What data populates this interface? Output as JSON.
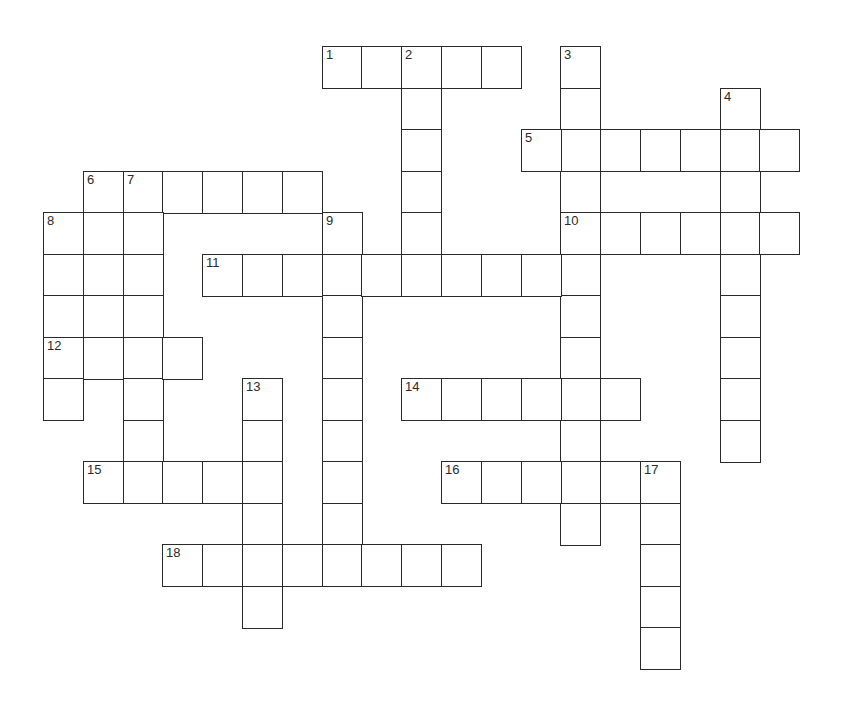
{
  "puzzle": {
    "title": "Crossword",
    "layout": {
      "origin_x": 43,
      "origin_y": 46,
      "cell_w": 39.8,
      "cell_h": 41.5
    },
    "colors": {
      "line": "#2a2a2a",
      "cell": "#ffffff",
      "background": "#ffffff"
    },
    "words": [
      {
        "number": 1,
        "direction": "across",
        "row": 0,
        "col": 7,
        "length": 5
      },
      {
        "number": 2,
        "direction": "down",
        "row": 0,
        "col": 9,
        "length": 6
      },
      {
        "number": 3,
        "direction": "down",
        "row": 0,
        "col": 13,
        "length": 12
      },
      {
        "number": 4,
        "direction": "down",
        "row": 1,
        "col": 17,
        "length": 9
      },
      {
        "number": 5,
        "direction": "across",
        "row": 2,
        "col": 12,
        "length": 7
      },
      {
        "number": 6,
        "direction": "across",
        "row": 3,
        "col": 1,
        "length": 6
      },
      {
        "number": 6,
        "direction": "down",
        "row": 3,
        "col": 1,
        "length": 5
      },
      {
        "number": 7,
        "direction": "down",
        "row": 3,
        "col": 2,
        "length": 8
      },
      {
        "number": 8,
        "direction": "down",
        "row": 4,
        "col": 0,
        "length": 5
      },
      {
        "number": 9,
        "direction": "down",
        "row": 4,
        "col": 7,
        "length": 9
      },
      {
        "number": 10,
        "direction": "across",
        "row": 4,
        "col": 13,
        "length": 6
      },
      {
        "number": 11,
        "direction": "across",
        "row": 5,
        "col": 4,
        "length": 10
      },
      {
        "number": 12,
        "direction": "across",
        "row": 7,
        "col": 0,
        "length": 4
      },
      {
        "number": 13,
        "direction": "down",
        "row": 8,
        "col": 5,
        "length": 6
      },
      {
        "number": 14,
        "direction": "across",
        "row": 8,
        "col": 9,
        "length": 6
      },
      {
        "number": 15,
        "direction": "across",
        "row": 10,
        "col": 1,
        "length": 5
      },
      {
        "number": 16,
        "direction": "across",
        "row": 10,
        "col": 10,
        "length": 6
      },
      {
        "number": 17,
        "direction": "down",
        "row": 10,
        "col": 15,
        "length": 5
      },
      {
        "number": 18,
        "direction": "across",
        "row": 12,
        "col": 3,
        "length": 8
      }
    ]
  }
}
